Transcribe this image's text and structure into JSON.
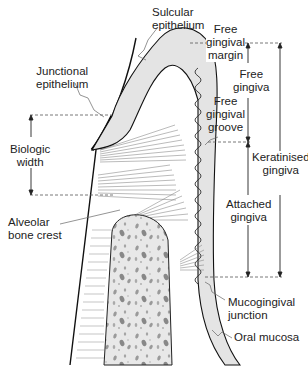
{
  "diagram": {
    "type": "anatomical-cross-section",
    "colors": {
      "tissue_fill": "#e4e4e4",
      "bone_fill": "#e8e8e8",
      "outline": "#111111",
      "fibres": "#777777",
      "dashed_lines": "#555555"
    }
  },
  "labels": {
    "sulcular_epithelium": {
      "line1": "Sulcular",
      "line2": "epithelium"
    },
    "junctional_epithelium": {
      "line1": "Junctional",
      "line2": "epithelium"
    },
    "biologic_width": {
      "line1": "Biologic",
      "line2": "width"
    },
    "alveolar_bone_crest": {
      "line1": "Alveolar",
      "line2": "bone crest"
    },
    "free_gingival_margin": {
      "line1": "Free",
      "line2": "gingival",
      "line3": "margin"
    },
    "free_gingiva": {
      "line1": "Free",
      "line2": "gingiva"
    },
    "free_gingival_groove": {
      "line1": "Free",
      "line2": "gingival",
      "line3": "groove"
    },
    "keratinised_gingiva": {
      "line1": "Keratinised",
      "line2": "gingiva"
    },
    "attached_gingiva": {
      "line1": "Attached",
      "line2": "gingiva"
    },
    "mucogingival_junction": {
      "line1": "Mucogingival",
      "line2": "junction"
    },
    "oral_mucosa": {
      "line1": "Oral mucosa"
    }
  }
}
